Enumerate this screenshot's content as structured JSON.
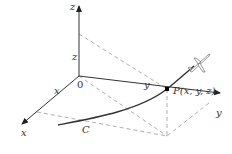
{
  "labels": {
    "z_axis": "z",
    "z_height": "z",
    "y_axis": "y",
    "y_length": "y",
    "x_axis": "x",
    "x_length": "x",
    "origin": "0",
    "point": "P(x, y, z)",
    "curve": "C"
  },
  "colors": {
    "axis": "#333333",
    "dashed": "#9a9a9a",
    "curve": "#333333",
    "point": "#000000"
  },
  "icons": {
    "airplane": "airplane-icon"
  }
}
